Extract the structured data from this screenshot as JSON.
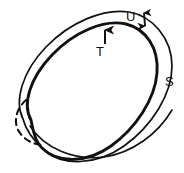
{
  "figure": {
    "background_color": "#ffffff",
    "stroke_color": "#111111",
    "width_px": 184,
    "height_px": 173,
    "labels": {
      "core_curve": "T",
      "band_width": "U",
      "outer_boundary": "S"
    },
    "annotations": [
      {
        "name": "arrow-to-core-curve",
        "label": "T",
        "style": "single-headed arrow pointing up",
        "points_to": "inner (core) curve of the band"
      },
      {
        "name": "double-arrow-band-width",
        "label": "U",
        "style": "double-headed arrow",
        "measures": "width of the band between inner and outer curves"
      },
      {
        "name": "outer-boundary-label",
        "label": "S",
        "style": "plain text label",
        "points_to": "outer boundary curve of the band"
      }
    ],
    "strokes": [
      {
        "name": "outer-boundary-curve",
        "dash": "solid",
        "weight": "thin"
      },
      {
        "name": "inner-core-curve",
        "dash": "solid",
        "weight": "thick"
      },
      {
        "name": "hidden-edge-arc",
        "dash": "dashed",
        "weight": "medium"
      }
    ]
  }
}
